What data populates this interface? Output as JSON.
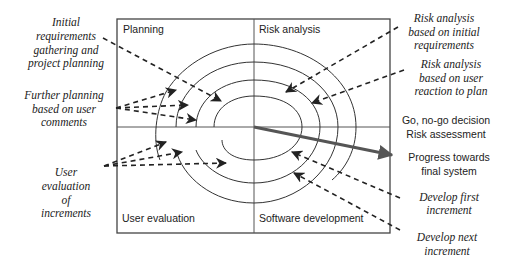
{
  "diagram": {
    "quadrants": {
      "top_left": "Planning",
      "top_right": "Risk analysis",
      "bottom_left": "User evaluation",
      "bottom_right": "Software development"
    },
    "annotations_left": {
      "initial": [
        "Initial",
        "requirements",
        "gathering and",
        "project planning"
      ],
      "further": [
        "Further planning",
        "based on user",
        "comments"
      ],
      "user_eval": [
        "User",
        "evaluation",
        "of",
        "increments"
      ]
    },
    "annotations_right": {
      "risk_initial": [
        "Risk analysis",
        "based on initial",
        "requirements"
      ],
      "risk_user": [
        "Risk analysis",
        "based on user",
        "reaction to plan"
      ],
      "go_nogo": [
        "Go, no-go decision",
        "Risk assessment"
      ],
      "progress": [
        "Progress towards",
        "final system"
      ],
      "dev_first": [
        "Develop first",
        "increment"
      ],
      "dev_next": [
        "Develop next",
        "increment"
      ]
    },
    "colors": {
      "line": "#333333",
      "progress_arrow": "#555555",
      "background": "#ffffff"
    }
  }
}
